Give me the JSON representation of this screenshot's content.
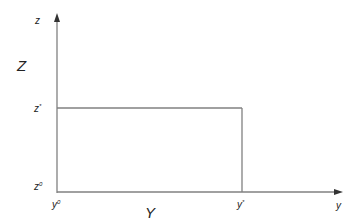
{
  "diagram": {
    "colors": {
      "axis": "#808080",
      "line": "#808080",
      "text": "#222222",
      "background": "#ffffff"
    },
    "axes": {
      "vertical": {
        "label": "z",
        "title": "Z",
        "ticks": [
          {
            "base": "z",
            "sup": "*"
          },
          {
            "base": "z",
            "sup": "0"
          }
        ]
      },
      "horizontal": {
        "label": "y",
        "title": "Y",
        "ticks": [
          {
            "base": "y",
            "sup": "0"
          },
          {
            "base": "y",
            "sup": "*"
          }
        ]
      }
    },
    "region": {
      "description": "rectangle bounded by z* and y*",
      "top_label": "z*",
      "right_label": "y*"
    }
  }
}
